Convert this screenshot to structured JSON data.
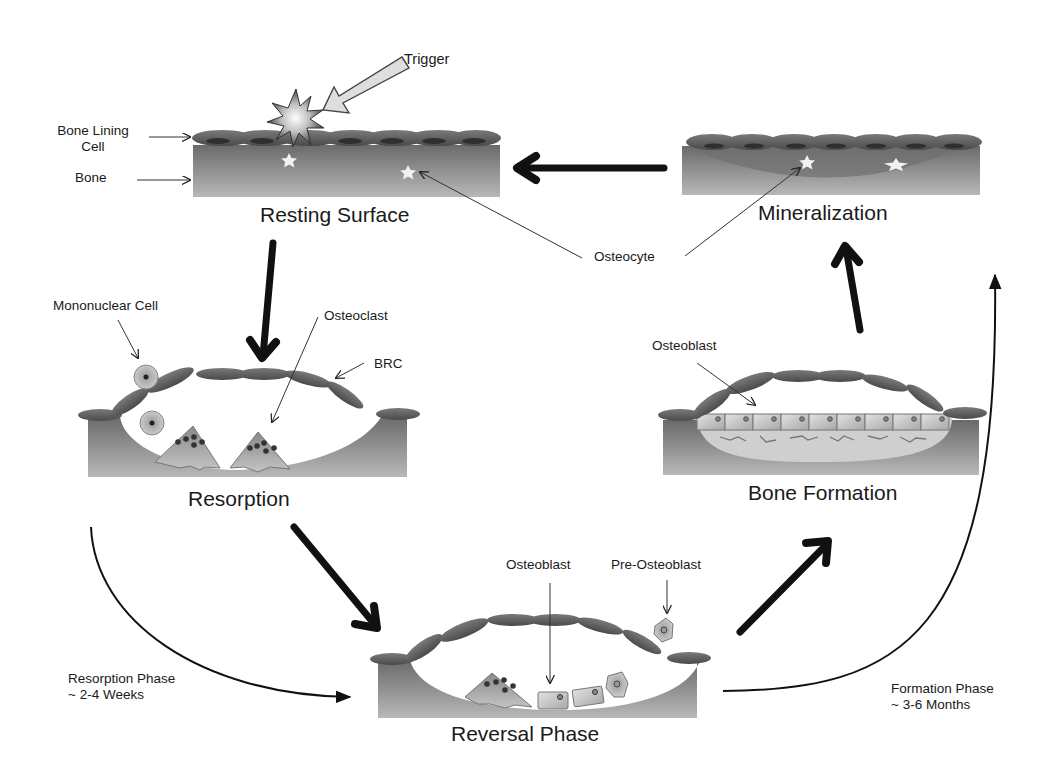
{
  "diagram": {
    "type": "bone-remodeling-cycle",
    "stages": [
      {
        "id": "resting",
        "label": "Resting Surface"
      },
      {
        "id": "resorption",
        "label": "Resorption"
      },
      {
        "id": "reversal",
        "label": "Reversal Phase"
      },
      {
        "id": "formation",
        "label": "Bone Formation"
      },
      {
        "id": "mineralization",
        "label": "Mineralization"
      }
    ],
    "annotations": {
      "trigger": "Trigger",
      "bone_lining_cell": "Bone Lining\nCell",
      "bone_lining_cell_line1": "Bone Lining",
      "bone_lining_cell_line2": "Cell",
      "bone": "Bone",
      "osteocyte": "Osteocyte",
      "mononuclear_cell": "Mononuclear Cell",
      "osteoclast": "Osteoclast",
      "brc": "BRC",
      "osteoblast_formation": "Osteoblast",
      "osteoblast_reversal": "Osteoblast",
      "pre_osteoblast": "Pre-Osteoblast"
    },
    "phases": {
      "resorption": {
        "name": "Resorption Phase",
        "duration": "~ 2-4 Weeks"
      },
      "formation": {
        "name": "Formation Phase",
        "duration": "~ 3-6 Months"
      }
    },
    "flow": [
      {
        "from": "Resting Surface",
        "to": "Resorption"
      },
      {
        "from": "Resorption",
        "to": "Reversal Phase"
      },
      {
        "from": "Reversal Phase",
        "to": "Bone Formation"
      },
      {
        "from": "Bone Formation",
        "to": "Mineralization"
      },
      {
        "from": "Mineralization",
        "to": "Resting Surface"
      }
    ],
    "colors": {
      "bone_dark": "#6e6e6e",
      "bone_light": "#b4b4b4",
      "lining_cell": "#555555",
      "arrow": "#111111",
      "cell_fill": "#c8c8c8",
      "background": "#ffffff"
    }
  }
}
